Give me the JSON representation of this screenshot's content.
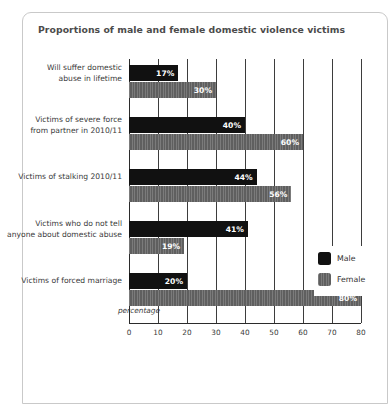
{
  "card": {
    "title": "Proportions of male and female domestic violence victims"
  },
  "legend": {
    "male_label": "Male",
    "female_label": "Female"
  },
  "chart_data": {
    "type": "bar",
    "orientation": "horizontal",
    "title": "Proportions of male and female domestic violence victims",
    "xlabel": "percentage",
    "ylabel": "",
    "xlim": [
      0,
      80
    ],
    "xticks": [
      0,
      10,
      20,
      30,
      40,
      50,
      60,
      70,
      80
    ],
    "xtick_labels": [
      "0",
      "10",
      "20",
      "30",
      "40",
      "50",
      "60",
      "70",
      "80"
    ],
    "grid": true,
    "legend_position": "center-right",
    "categories": [
      "Will suffer domestic abuse in lifetime",
      "Victims of severe force from partner in 2010/11",
      "Victims of stalking 2010/11",
      "Victims who do not tell anyone about domestic abuse",
      "Victims of forced marriage"
    ],
    "category_lines": [
      [
        "Will suffer domestic",
        "abuse in lifetime"
      ],
      [
        "Victims of severe force",
        "from partner in 2010/11"
      ],
      [
        "Victims of stalking 2010/11"
      ],
      [
        "Victims who do not tell",
        "anyone about domestic abuse"
      ],
      [
        "Victims of forced marriage"
      ]
    ],
    "series": [
      {
        "name": "Male",
        "color": "#111111",
        "values": [
          17,
          40,
          44,
          41,
          20
        ],
        "value_labels": [
          "17%",
          "40%",
          "44%",
          "41%",
          "20%"
        ]
      },
      {
        "name": "Female",
        "color": "#6e6e6e",
        "values": [
          30,
          60,
          56,
          19,
          80
        ],
        "value_labels": [
          "30%",
          "60%",
          "56%",
          "19%",
          "80%"
        ]
      }
    ]
  }
}
